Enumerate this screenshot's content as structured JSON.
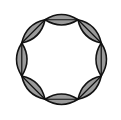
{
  "diagram": {
    "title": "Ring of eight lenses",
    "shape": "lens-ring",
    "lens_count": 8,
    "center": [
      61.5,
      59.5
    ],
    "radius": 43,
    "start_angle_deg": -112.5,
    "bulge": 0.32,
    "colors": {
      "fill": "#9a9a9a",
      "stroke": "#111111",
      "background": "#ffffff"
    }
  }
}
